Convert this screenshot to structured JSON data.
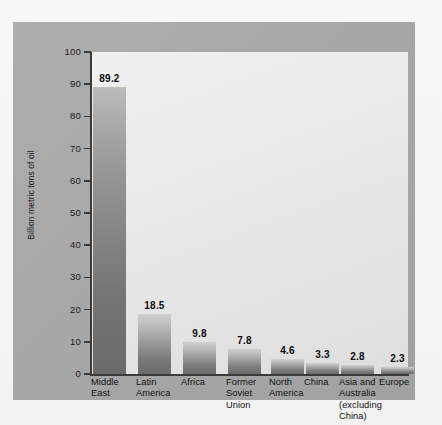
{
  "chart_data": {
    "type": "bar",
    "title": "",
    "subtitle": "",
    "xlabel": "",
    "ylabel": "Billion metric tons of oil",
    "ylim": [
      0,
      100
    ],
    "yticks": [
      0,
      10,
      20,
      30,
      40,
      50,
      60,
      70,
      80,
      90,
      100
    ],
    "ytick_labels": [
      "0",
      "10",
      "20",
      "30",
      "40",
      "50",
      "60",
      "70",
      "80",
      "90",
      "100"
    ],
    "grid": false,
    "legend": false,
    "categories": [
      "Middle East",
      "Latin America",
      "Africa",
      "Former Soviet Union",
      "North America",
      "China",
      "Asia and Australia (excluding China)",
      "Europe"
    ],
    "category_lines": [
      [
        "Middle",
        "East"
      ],
      [
        "Latin",
        "America"
      ],
      [
        "Africa"
      ],
      [
        "Former",
        "Soviet",
        "Union"
      ],
      [
        "North",
        "America"
      ],
      [
        "China"
      ],
      [
        "Asia and",
        "Australia",
        "(excluding",
        "China)"
      ],
      [
        "Europe"
      ]
    ],
    "values": [
      89.2,
      18.5,
      9.8,
      7.8,
      4.6,
      3.3,
      2.8,
      2.3
    ],
    "value_labels": [
      "89.2",
      "18.5",
      "9.8",
      "7.8",
      "4.6",
      "3.3",
      "2.8",
      "2.3"
    ],
    "colors": {
      "panel": "#a9a9a9",
      "plot_background": "#eaeaea",
      "bar_top": "#d0d0d0",
      "bar_bottom": "#6b6b6b",
      "axis": "#3a3a3a",
      "text": "#111111"
    }
  }
}
